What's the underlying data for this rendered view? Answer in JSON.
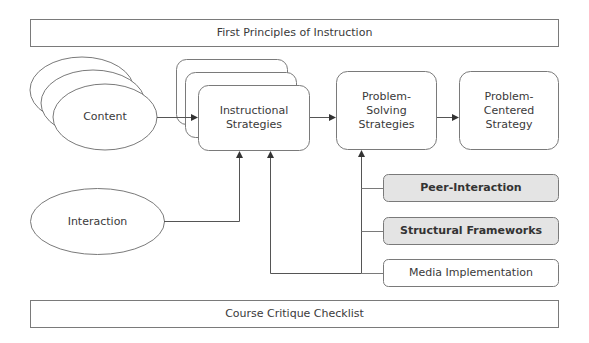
{
  "diagram": {
    "header": {
      "label": "First Principles of Instruction"
    },
    "footer": {
      "label": "Course Critique Checklist"
    },
    "nodes": {
      "content": {
        "label": "Content",
        "shape": "stacked-ellipse"
      },
      "interaction": {
        "label": "Interaction",
        "shape": "ellipse"
      },
      "instructional_strategies": {
        "label": "Instructional\nStrategies",
        "shape": "stacked-rounded-rect"
      },
      "problem_solving": {
        "label": "Problem-\nSolving\nStrategies",
        "shape": "rounded-rect"
      },
      "problem_centered": {
        "label": "Problem-\nCentered\nStrategy",
        "shape": "rounded-rect"
      },
      "peer_interaction": {
        "label": "Peer-Interaction",
        "shape": "rounded-rect",
        "fill": "#e4e4e4"
      },
      "structural_frameworks": {
        "label": "Structural Frameworks",
        "shape": "rounded-rect",
        "fill": "#e4e4e4"
      },
      "media_implementation": {
        "label": "Media Implementation",
        "shape": "rounded-rect",
        "fill": "#ffffff"
      }
    },
    "edges": [
      {
        "from": "Content",
        "to": "Instructional Strategies"
      },
      {
        "from": "Instructional Strategies",
        "to": "Problem-Solving Strategies"
      },
      {
        "from": "Problem-Solving Strategies",
        "to": "Problem-Centered Strategy"
      },
      {
        "from": "Interaction",
        "to": "Instructional Strategies"
      },
      {
        "from": "Peer-Interaction",
        "to": "Problem-Solving Strategies"
      },
      {
        "from": "Structural Frameworks",
        "to": "Problem-Solving Strategies"
      },
      {
        "from": "Media Implementation",
        "to": "Problem-Solving Strategies"
      },
      {
        "from": "Media Implementation",
        "to": "Instructional Strategies"
      }
    ],
    "colors": {
      "stroke": "#7a7a7a",
      "highlight_fill": "#e4e4e4",
      "text": "#3a3a3a"
    }
  }
}
